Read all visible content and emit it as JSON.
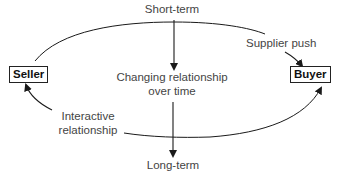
{
  "diagram": {
    "nodes": {
      "seller": {
        "label": "Seller"
      },
      "buyer": {
        "label": "Buyer"
      }
    },
    "labels": {
      "short_term": "Short-term",
      "long_term": "Long-term",
      "changing_line1": "Changing relationship",
      "changing_line2": "over time",
      "supplier_push": "Supplier push",
      "interactive_line1": "Interactive",
      "interactive_line2": "relationship"
    },
    "edges": [
      {
        "from": "seller",
        "to": "buyer",
        "label": "Supplier push",
        "shape": "upper-arc"
      },
      {
        "from": "buyer",
        "to": "seller",
        "label": "Interactive relationship",
        "shape": "lower-arc"
      },
      {
        "from": "short_term",
        "to": "long_term",
        "label": "Changing relationship over time",
        "shape": "vertical"
      }
    ],
    "colors": {
      "line": "#1a1a1a",
      "text": "#444444",
      "box_border": "#222222"
    }
  }
}
